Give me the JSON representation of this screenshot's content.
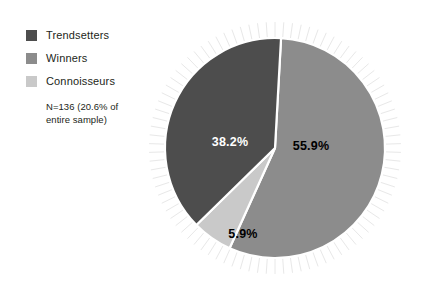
{
  "chart_data": {
    "type": "pie",
    "title": "",
    "categories": [
      "Trendsetters",
      "Winners",
      "Connoisseurs"
    ],
    "values": [
      38.2,
      55.9,
      5.9
    ],
    "value_labels": [
      "38.2%",
      "55.9%",
      "5.9%"
    ],
    "units": "percent",
    "annotation": "N=136 (20.6% of entire sample)",
    "legend_position": "left",
    "grid": false,
    "colors": {
      "trendsetters": "#4d4d4d",
      "winners": "#8c8c8c",
      "connoisseurs": "#c9c9c9",
      "separator": "#ffffff",
      "radial_ticks": "#e8e8e8",
      "label_dark": "#000000",
      "label_light": "#ffffff",
      "text": "#231f20",
      "background": "#ffffff"
    },
    "slices": [
      {
        "name": "Winners",
        "label": "55.9%",
        "value": 55.9,
        "color": "#8c8c8c",
        "label_color": "#000000",
        "label_x": 311,
        "label_y": 147
      },
      {
        "name": "Trendsetters",
        "label": "38.2%",
        "value": 38.2,
        "color": "#4d4d4d",
        "label_color": "#ffffff",
        "label_x": 230,
        "label_y": 143
      },
      {
        "name": "Connoisseurs",
        "label": "5.9%",
        "value": 5.9,
        "color": "#c9c9c9",
        "label_color": "#000000",
        "label_x": 243,
        "label_y": 235
      }
    ]
  },
  "legend": {
    "items": [
      {
        "label": "Trendsetters",
        "color": "#4d4d4d",
        "icon": "legend-swatch-icon"
      },
      {
        "label": "Winners",
        "color": "#8c8c8c",
        "icon": "legend-swatch-icon"
      },
      {
        "label": "Connoisseurs",
        "color": "#c9c9c9",
        "icon": "legend-swatch-icon"
      }
    ],
    "note_line_1": "N=136 (20.6% of",
    "note_line_2": "entire sample)"
  }
}
